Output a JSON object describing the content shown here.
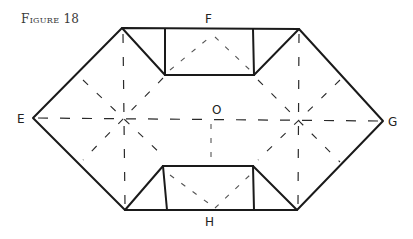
{
  "figure": {
    "title": "Figure 18",
    "labels": {
      "top": "F",
      "left": "E",
      "right": "G",
      "bottom": "H",
      "center": "O"
    },
    "line_color": "#1a1a1a"
  }
}
